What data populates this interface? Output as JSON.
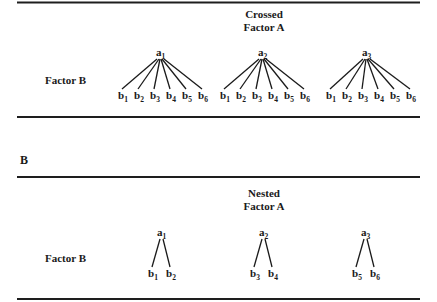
{
  "panels": [
    {
      "id": "crossed",
      "panel_label": "",
      "title_line1": "Crossed",
      "title_line2": "Factor A",
      "row_label": "Factor B",
      "groups": [
        {
          "a": {
            "base": "a",
            "sub": "1"
          },
          "bs": [
            [
              "b",
              "1"
            ],
            [
              "b",
              "2"
            ],
            [
              "b",
              "3"
            ],
            [
              "b",
              "4"
            ],
            [
              "b",
              "5"
            ],
            [
              "b",
              "6"
            ]
          ]
        },
        {
          "a": {
            "base": "a",
            "sub": "2"
          },
          "bs": [
            [
              "b",
              "1"
            ],
            [
              "b",
              "2"
            ],
            [
              "b",
              "3"
            ],
            [
              "b",
              "4"
            ],
            [
              "b",
              "5"
            ],
            [
              "b",
              "6"
            ]
          ]
        },
        {
          "a": {
            "base": "a",
            "sub": "3"
          },
          "bs": [
            [
              "b",
              "1"
            ],
            [
              "b",
              "2"
            ],
            [
              "b",
              "3"
            ],
            [
              "b",
              "4"
            ],
            [
              "b",
              "5"
            ],
            [
              "b",
              "6"
            ]
          ]
        }
      ]
    },
    {
      "id": "nested",
      "panel_label": "B",
      "title_line1": "Nested",
      "title_line2": "Factor A",
      "row_label": "Factor B",
      "groups": [
        {
          "a": {
            "base": "a",
            "sub": "1"
          },
          "bs": [
            [
              "b",
              "1"
            ],
            [
              "b",
              "2"
            ]
          ]
        },
        {
          "a": {
            "base": "a",
            "sub": "2"
          },
          "bs": [
            [
              "b",
              "3"
            ],
            [
              "b",
              "4"
            ]
          ]
        },
        {
          "a": {
            "base": "a",
            "sub": "3"
          },
          "bs": [
            [
              "b",
              "5"
            ],
            [
              "b",
              "6"
            ]
          ]
        }
      ]
    }
  ]
}
